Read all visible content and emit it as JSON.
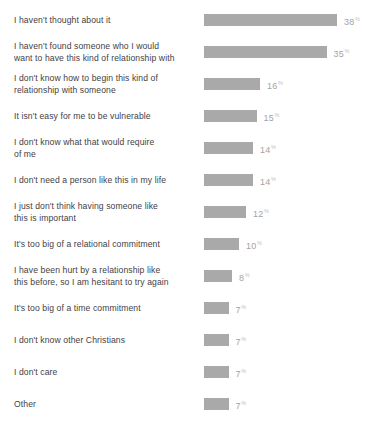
{
  "chart_data": {
    "type": "bar",
    "orientation": "horizontal",
    "title": "",
    "xlabel": "",
    "ylabel": "",
    "xlim": [
      0,
      40
    ],
    "grid": false,
    "legend": false,
    "value_suffix": "%",
    "bar_color": "#a9a9a9",
    "label_color": "#3f4145",
    "value_color": "#a3a3a3",
    "background": "#ffffff",
    "categories": [
      "I haven't thought about it",
      "I haven't found someone who I would\nwant to have this kind of relationship with",
      "I don't know how to begin this kind of\nrelationship with someone",
      "It isn't easy for me to be vulnerable",
      "I don't know what that would require\nof me",
      "I don't need a person like this in my life",
      "I just don't think having someone like\nthis is important",
      "It's too big of a relational commitment",
      "I have been hurt by a relationship like\nthis before, so I am hesitant to try again",
      "It's too big of a time commitment",
      "I don't know other Christians",
      "I don't care",
      "Other"
    ],
    "values": [
      38,
      35,
      16,
      15,
      14,
      14,
      12,
      10,
      8,
      7,
      7,
      7,
      7
    ],
    "value_labels": [
      "38",
      "35",
      "16",
      "15",
      "14",
      "14",
      "12",
      "10",
      "8",
      "7",
      "7",
      "7",
      "7"
    ]
  }
}
